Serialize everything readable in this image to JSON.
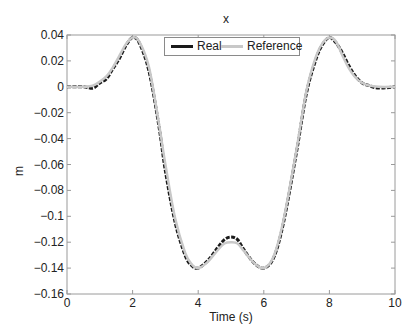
{
  "chart_data": {
    "type": "line",
    "title": "x",
    "xlabel": "Time (s)",
    "ylabel": "m",
    "xlim": [
      0,
      10
    ],
    "ylim": [
      -0.16,
      0.04
    ],
    "xticks": [
      "0",
      "2",
      "4",
      "6",
      "8",
      "10"
    ],
    "yticks": [
      "0.04",
      "0.02",
      "0",
      "-0.02",
      "-0.04",
      "-0.06",
      "-0.08",
      "-0.1",
      "-0.12",
      "-0.14",
      "-0.16"
    ],
    "grid": false,
    "legend_position": "top-center",
    "series": [
      {
        "name": "Real",
        "color": "#1a1a1a",
        "x": [
          0,
          0.5,
          0.8,
          1.0,
          1.2,
          1.4,
          1.6,
          1.8,
          2.0,
          2.2,
          2.5,
          2.8,
          3.0,
          3.3,
          3.6,
          3.8,
          4.0,
          4.3,
          4.6,
          4.8,
          5.0,
          5.2,
          5.4,
          5.7,
          6.0,
          6.3,
          6.6,
          7.0,
          7.3,
          7.6,
          7.8,
          8.0,
          8.2,
          8.4,
          8.6,
          8.8,
          9.0,
          9.2,
          9.5,
          10.0
        ],
        "y": [
          0,
          0,
          -0.001,
          0.003,
          0.006,
          0.014,
          0.022,
          0.032,
          0.038,
          0.034,
          0.012,
          -0.03,
          -0.065,
          -0.105,
          -0.13,
          -0.138,
          -0.14,
          -0.134,
          -0.124,
          -0.118,
          -0.116,
          -0.118,
          -0.126,
          -0.136,
          -0.14,
          -0.132,
          -0.105,
          -0.05,
          -0.005,
          0.022,
          0.033,
          0.038,
          0.034,
          0.026,
          0.016,
          0.008,
          0.003,
          0.001,
          -0.001,
          0
        ]
      },
      {
        "name": "Reference",
        "color": "#c8c8c8",
        "x": [
          0,
          0.5,
          0.8,
          1.0,
          1.2,
          1.4,
          1.6,
          1.8,
          2.0,
          2.2,
          2.5,
          2.8,
          3.0,
          3.3,
          3.6,
          3.8,
          4.0,
          4.3,
          4.6,
          4.8,
          5.0,
          5.2,
          5.4,
          5.7,
          6.0,
          6.3,
          6.6,
          7.0,
          7.3,
          7.6,
          7.8,
          8.0,
          8.2,
          8.4,
          8.6,
          8.8,
          9.0,
          9.2,
          9.5,
          10.0
        ],
        "y": [
          0,
          0,
          0.001,
          0.004,
          0.008,
          0.015,
          0.024,
          0.033,
          0.038,
          0.035,
          0.015,
          -0.028,
          -0.06,
          -0.102,
          -0.128,
          -0.137,
          -0.14,
          -0.135,
          -0.126,
          -0.121,
          -0.12,
          -0.121,
          -0.127,
          -0.136,
          -0.14,
          -0.131,
          -0.103,
          -0.048,
          -0.003,
          0.024,
          0.034,
          0.038,
          0.035,
          0.024,
          0.014,
          0.007,
          0.003,
          0.001,
          0,
          0
        ]
      }
    ]
  },
  "labels": {
    "title": "x",
    "xlabel": "Time (s)",
    "ylabel": "m",
    "legend_real": "Real",
    "legend_reference": "Reference"
  }
}
